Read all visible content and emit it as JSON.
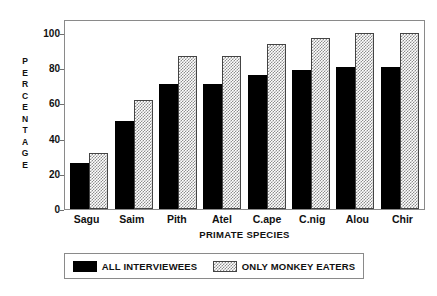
{
  "chart_data": {
    "type": "bar",
    "title": "",
    "subtitle": "",
    "xlabel": "PRIMATE SPECIES",
    "ylabel": "PERCENTAGE",
    "categories": [
      "Sagu",
      "Saim",
      "Pith",
      "Atel",
      "C.ape",
      "C.nig",
      "Alou",
      "Chir"
    ],
    "series": [
      {
        "name": "ALL INTERVIEWEES",
        "style": "solid-black",
        "color": "#000000",
        "values": [
          26,
          50,
          71,
          71,
          76,
          79,
          81,
          81
        ]
      },
      {
        "name": "ONLY MONKEY EATERS",
        "style": "checkered-hatch",
        "color": "#8d8d8d",
        "values": [
          32,
          62,
          87,
          87,
          94,
          97,
          100,
          100
        ]
      }
    ],
    "ylim": [
      0,
      108
    ],
    "yticks": [
      0,
      20,
      40,
      60,
      80,
      100
    ],
    "ytick_labels": [
      "0",
      "20",
      "40",
      "60",
      "80",
      "100"
    ],
    "grid": false,
    "legend_position": "below-axis",
    "axis_frame": true
  },
  "axis": {
    "y_title_letters": [
      "P",
      "E",
      "R",
      "C",
      "E",
      "N",
      "T",
      "A",
      "G",
      "E"
    ]
  },
  "legend": {
    "items": [
      {
        "label": "ALL INTERVIEWEES",
        "swatch": "solid-black-swatch"
      },
      {
        "label": "ONLY MONKEY EATERS",
        "swatch": "hatched-gray-swatch"
      }
    ]
  }
}
